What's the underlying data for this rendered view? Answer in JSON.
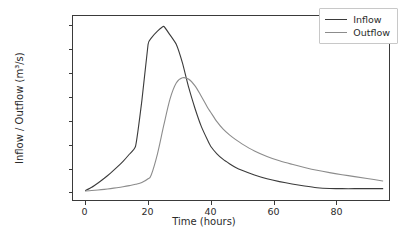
{
  "chart_data": {
    "type": "line",
    "title": "",
    "xlabel": "Time (hours)",
    "ylabel": "Inflow / Outflow (m³/s)",
    "xlim": [
      -4,
      97
    ],
    "ylim": [
      -90,
      1860
    ],
    "xticks": [
      0,
      20,
      40,
      60,
      80
    ],
    "yticks": [
      0,
      250,
      500,
      750,
      1000,
      1250,
      1500,
      1750
    ],
    "grid": false,
    "legend_position": "upper right",
    "x": [
      0,
      2,
      4,
      6,
      8,
      10,
      12,
      14,
      16,
      18,
      20,
      21,
      23,
      25,
      27,
      29,
      31,
      33,
      35,
      37,
      39,
      40,
      42,
      44,
      46,
      48,
      50,
      54,
      58,
      62,
      66,
      70,
      74,
      78,
      82,
      86,
      90,
      95
    ],
    "series": [
      {
        "name": "Inflow",
        "color": "#3b3b3b",
        "values": [
          10,
          45,
          90,
          140,
          195,
          255,
          320,
          395,
          480,
          960,
          1560,
          1625,
          1700,
          1750,
          1660,
          1560,
          1360,
          1100,
          880,
          690,
          545,
          480,
          400,
          340,
          295,
          255,
          225,
          175,
          135,
          105,
          80,
          58,
          40,
          32,
          30,
          30,
          30,
          30
        ]
      },
      {
        "name": "Outflow",
        "color": "#8c8c8c",
        "values": [
          5,
          10,
          16,
          23,
          31,
          40,
          50,
          62,
          76,
          95,
          135,
          175,
          400,
          700,
          980,
          1150,
          1205,
          1190,
          1120,
          1010,
          890,
          840,
          740,
          660,
          600,
          550,
          505,
          430,
          372,
          325,
          288,
          255,
          225,
          200,
          178,
          158,
          138,
          112
        ]
      }
    ]
  },
  "legend": {
    "entries": [
      {
        "label": "Inflow"
      },
      {
        "label": "Outflow"
      }
    ]
  },
  "axes": {
    "x_tick_labels": [
      "0",
      "20",
      "40",
      "60",
      "80"
    ],
    "y_tick_labels": [
      "0",
      "250",
      "500",
      "750",
      "1000",
      "1250",
      "1500",
      "1750"
    ],
    "x_axis_label": "Time (hours)",
    "y_axis_label": "Inflow / Outflow (m³/s)"
  },
  "colors": {
    "inflow": "#3b3b3b",
    "outflow": "#8c8c8c",
    "axis": "#3a3a3a",
    "background": "#ffffff"
  }
}
